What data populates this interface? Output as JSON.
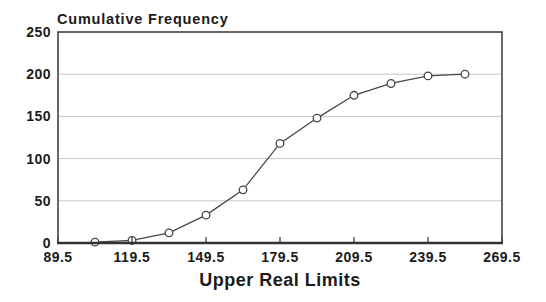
{
  "chart_data": {
    "type": "line",
    "title": "Cumulative Frequency",
    "xlabel": "Upper Real Limits",
    "ylabel": "",
    "x": [
      104.5,
      119.5,
      134.5,
      149.5,
      164.5,
      179.5,
      194.5,
      209.5,
      224.5,
      239.5,
      254.5
    ],
    "values": [
      1,
      3,
      12,
      33,
      63,
      118,
      148,
      175,
      189,
      198,
      200
    ],
    "x_ticks": [
      89.5,
      119.5,
      149.5,
      179.5,
      209.5,
      239.5,
      269.5
    ],
    "x_tick_labels": [
      "89.5",
      "119.5",
      "149.5",
      "179.5",
      "209.5",
      "239.5",
      "269.5"
    ],
    "y_ticks": [
      0,
      50,
      100,
      150,
      200,
      250
    ],
    "y_tick_labels": [
      "0",
      "50",
      "100",
      "150",
      "200",
      "250"
    ],
    "xlim": [
      89.5,
      269.5
    ],
    "ylim": [
      0,
      250
    ],
    "grid": "horizontal",
    "legend": "none",
    "marker": "open-circle",
    "colors": {
      "line": "#474747",
      "marker_fill": "#ffffff",
      "grid": "#c6c6c6",
      "frame": "#4d4d4d",
      "axis": "#333333",
      "text": "#1b1b1b",
      "background": "#ffffff"
    }
  }
}
